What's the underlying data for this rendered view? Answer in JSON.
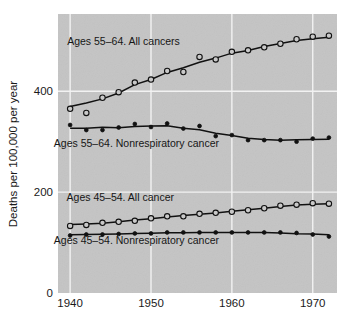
{
  "chart_data": {
    "type": "line",
    "title": "",
    "xlabel": "",
    "ylabel": "Deaths per 100,000 per year",
    "xlim": [
      1938.5,
      1973.0
    ],
    "ylim": [
      0,
      553
    ],
    "xticks": [
      1940,
      1950,
      1960,
      1970
    ],
    "xtick_labels": [
      "1940",
      "1950",
      "1960",
      "1970"
    ],
    "yticks": [
      0,
      200,
      400
    ],
    "ytick_labels": [
      "0",
      "200",
      "400"
    ],
    "grid": "white gridlines on gray panel, vertical at x ticks, horizontal at y ticks",
    "legend_position": "inline annotations next to each series",
    "plot_bg_color": "#c4c4c4",
    "page_bg_color": "#ffffff",
    "line_color": "#111111",
    "gridline_color": "#f2f2f2",
    "annotations": [
      {
        "id": "ann-55-64-all",
        "text": "Ages 55–64. All cancers",
        "x": 1946.6,
        "y": 492
      },
      {
        "id": "ann-55-64-nonresp",
        "text": "Ages 55–64. Nonrespiratory cancer",
        "x": 1948.2,
        "y": 290
      },
      {
        "id": "ann-45-54-all",
        "text": "Ages 45–54. All cancer",
        "x": 1946.2,
        "y": 182
      },
      {
        "id": "ann-45-54-nonresp",
        "text": "Ages 45–54. Nonrespiratory cancer",
        "x": 1948.2,
        "y": 97
      }
    ],
    "series": [
      {
        "name": "Ages 55–64. All cancers",
        "marker": "open-circle",
        "has_fit_line": true,
        "x": [
          1940,
          1942,
          1944,
          1946,
          1948,
          1950,
          1952,
          1954,
          1956,
          1958,
          1960,
          1962,
          1964,
          1966,
          1968,
          1970,
          1972
        ],
        "values": [
          365,
          357,
          387,
          398,
          417,
          423,
          440,
          438,
          468,
          463,
          478,
          481,
          487,
          494,
          503,
          508,
          510
        ]
      },
      {
        "name": "Ages 55–64. Nonrespiratory cancer",
        "marker": "filled-circle",
        "has_fit_line": true,
        "x": [
          1940,
          1942,
          1944,
          1946,
          1948,
          1950,
          1952,
          1954,
          1956,
          1958,
          1960,
          1962,
          1964,
          1966,
          1968,
          1970,
          1972
        ],
        "values": [
          333,
          323,
          323,
          328,
          335,
          329,
          336,
          326,
          331,
          311,
          313,
          303,
          303,
          303,
          300,
          306,
          308
        ]
      },
      {
        "name": "Ages 45–54. All cancer",
        "marker": "open-circle",
        "has_fit_line": true,
        "x": [
          1940,
          1942,
          1944,
          1946,
          1948,
          1950,
          1952,
          1954,
          1956,
          1958,
          1960,
          1962,
          1964,
          1966,
          1968,
          1970,
          1972
        ],
        "values": [
          133,
          135,
          139,
          141,
          143,
          148,
          152,
          152,
          157,
          159,
          161,
          164,
          168,
          173,
          175,
          178,
          177
        ]
      },
      {
        "name": "Ages 45–54. Nonrespiratory cancer",
        "marker": "filled-circle",
        "has_fit_line": true,
        "x": [
          1940,
          1942,
          1944,
          1946,
          1948,
          1950,
          1952,
          1954,
          1956,
          1958,
          1960,
          1962,
          1964,
          1966,
          1968,
          1970,
          1972
        ],
        "values": [
          114,
          116,
          116,
          117,
          118,
          118,
          120,
          120,
          120,
          120,
          120,
          120,
          120,
          120,
          119,
          116,
          112
        ]
      }
    ]
  }
}
